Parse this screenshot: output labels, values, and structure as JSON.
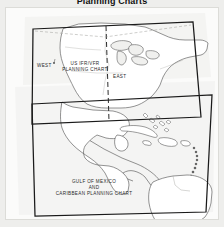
{
  "figure": {
    "title": "Planning Charts",
    "kind": "aeronautical-planning-chart-coverage-map"
  },
  "colors": {
    "background": "#eeeeec",
    "page": "#fbfbfa",
    "coastline": "#5a5a5a",
    "chart_outline": "#1a1a1a",
    "divider": "#2b2b2b",
    "label_text": "#2a2a2a",
    "title_text": "#111111"
  },
  "labels": {
    "west": "WEST",
    "east": "EAST",
    "us_chart_line1": "US IFR/VFR",
    "us_chart_line2": "PLANNING CHART",
    "gulf_line1": "GULF OF MEXICO",
    "gulf_line2": "AND",
    "gulf_line3": "CARIBBEAN PLANNING CHART"
  },
  "charts": [
    {
      "name": "us-ifr-vfr-planning-chart",
      "label": "US IFR/VFR PLANNING CHART",
      "halves": [
        "WEST",
        "EAST"
      ],
      "divider": "dashed-vertical"
    },
    {
      "name": "gulf-of-mexico-and-caribbean-planning-chart",
      "label": "GULF OF MEXICO AND CARIBBEAN PLANNING CHART",
      "halves": [],
      "divider": "none"
    }
  ]
}
